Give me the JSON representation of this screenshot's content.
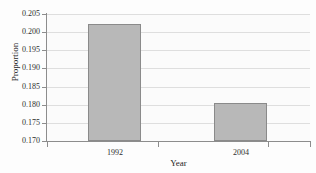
{
  "chart_data": {
    "type": "bar",
    "title": "",
    "categories": [
      "1992",
      "2004"
    ],
    "values": [
      0.2022,
      0.1805
    ],
    "xlabel": "Year",
    "ylabel": "Proportion",
    "ylim": [
      0.17,
      0.205
    ],
    "ytick_labels": [
      "0.205",
      "0.200",
      "0.195",
      "0.190",
      "0.185",
      "0.180",
      "0.175",
      "0.170"
    ],
    "ytick_values": [
      0.205,
      0.2,
      0.195,
      0.19,
      0.185,
      0.18,
      0.175,
      0.17
    ],
    "xtick_labels": [
      "1992",
      "2004"
    ],
    "grid": true,
    "legend": null,
    "bar_color": "#b8b8b8",
    "bar_edge_color": "#8a8a8a",
    "axis_color": "#8d8d8d",
    "gridline_color": "#dedede",
    "plot_background": "#fbfbfb"
  }
}
